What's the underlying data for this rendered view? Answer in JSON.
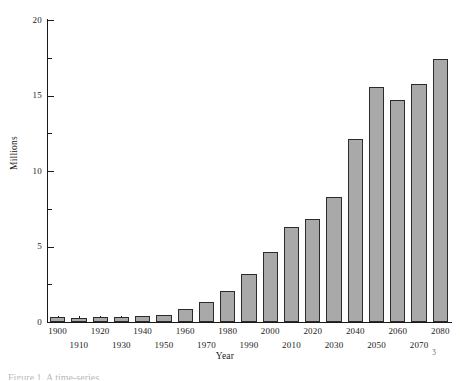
{
  "chart_data": {
    "type": "bar",
    "title": "",
    "xlabel": "Year",
    "ylabel": "Millions",
    "categories": [
      "1900",
      "1910",
      "1920",
      "1930",
      "1940",
      "1950",
      "1960",
      "1970",
      "1980",
      "1990",
      "2000",
      "2010",
      "2020",
      "2030",
      "2040",
      "2050",
      "2060",
      "2070",
      "2080"
    ],
    "values": [
      0.3,
      0.28,
      0.35,
      0.32,
      0.42,
      0.45,
      0.85,
      1.3,
      2.05,
      3.15,
      4.65,
      6.3,
      6.85,
      8.3,
      12.1,
      15.55,
      14.7,
      15.75,
      17.45
    ],
    "ylim": [
      0,
      20
    ],
    "yticks_major": [
      0,
      5,
      10,
      15,
      20
    ],
    "yticks_minor": [
      2.5,
      7.5,
      12.5,
      17.5
    ],
    "ytick_labels": [
      "0",
      "5",
      "10",
      "15",
      "20"
    ],
    "grid": false,
    "legend": null,
    "bar_fill": "#a9a9a9",
    "bar_edge": "#2b2b2b",
    "axis_color": "#1a1a1a"
  },
  "figure": {
    "artifact_mark": "ʒ",
    "caption_fragment": "Figure 1. A time-series"
  }
}
